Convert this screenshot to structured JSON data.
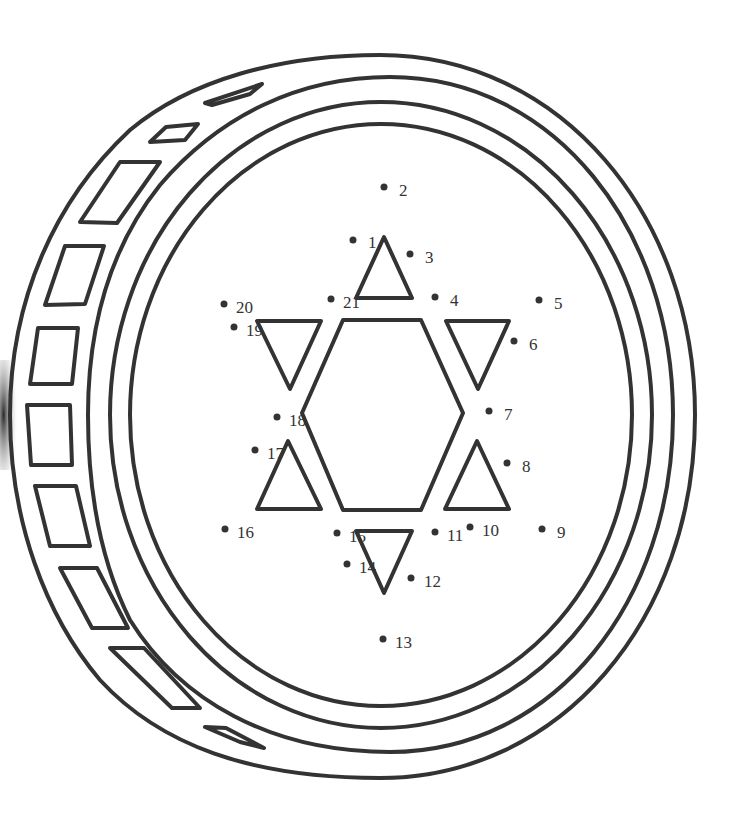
{
  "image": {
    "description": "Connect-the-dots worksheet: a coin (gelt) seen at an angle with a Star of David in the center",
    "colors": {
      "ink": "#333333",
      "background": "#ffffff",
      "edge_shadow": "#444444"
    }
  },
  "dots": [
    {
      "n": "1",
      "x": 353,
      "y": 240,
      "lx": 368,
      "ly": 248
    },
    {
      "n": "2",
      "x": 384,
      "y": 187,
      "lx": 399,
      "ly": 196
    },
    {
      "n": "3",
      "x": 410,
      "y": 254,
      "lx": 425,
      "ly": 263
    },
    {
      "n": "4",
      "x": 435,
      "y": 297,
      "lx": 450,
      "ly": 306
    },
    {
      "n": "5",
      "x": 539,
      "y": 300,
      "lx": 554,
      "ly": 309
    },
    {
      "n": "6",
      "x": 514,
      "y": 341,
      "lx": 529,
      "ly": 350
    },
    {
      "n": "7",
      "x": 489,
      "y": 411,
      "lx": 504,
      "ly": 420
    },
    {
      "n": "8",
      "x": 507,
      "y": 463,
      "lx": 522,
      "ly": 472
    },
    {
      "n": "9",
      "x": 542,
      "y": 529,
      "lx": 557,
      "ly": 538
    },
    {
      "n": "10",
      "x": 470,
      "y": 527,
      "lx": 482,
      "ly": 536
    },
    {
      "n": "11",
      "x": 435,
      "y": 532,
      "lx": 447,
      "ly": 541
    },
    {
      "n": "12",
      "x": 411,
      "y": 578,
      "lx": 424,
      "ly": 587
    },
    {
      "n": "13",
      "x": 383,
      "y": 639,
      "lx": 395,
      "ly": 648
    },
    {
      "n": "14",
      "x": 347,
      "y": 564,
      "lx": 359,
      "ly": 573
    },
    {
      "n": "15",
      "x": 337,
      "y": 533,
      "lx": 349,
      "ly": 542
    },
    {
      "n": "16",
      "x": 225,
      "y": 529,
      "lx": 237,
      "ly": 538
    },
    {
      "n": "17",
      "x": 255,
      "y": 450,
      "lx": 267,
      "ly": 459
    },
    {
      "n": "18",
      "x": 277,
      "y": 417,
      "lx": 289,
      "ly": 426
    },
    {
      "n": "19",
      "x": 234,
      "y": 327,
      "lx": 246,
      "ly": 336
    },
    {
      "n": "20",
      "x": 224,
      "y": 304,
      "lx": 236,
      "ly": 313
    },
    {
      "n": "21",
      "x": 331,
      "y": 299,
      "lx": 343,
      "ly": 308
    }
  ],
  "star": {
    "hexagon": "343,320 421,320 463,413 421,510 343,510 302,413",
    "triangles": [
      "384,237 412,298 356,298",
      "257,321 321,321 290,389",
      "446,321 509,321 478,389",
      "288,441 321,509 257,509",
      "477,441 509,509 445,509",
      "356,531 412,531 384,593"
    ]
  }
}
